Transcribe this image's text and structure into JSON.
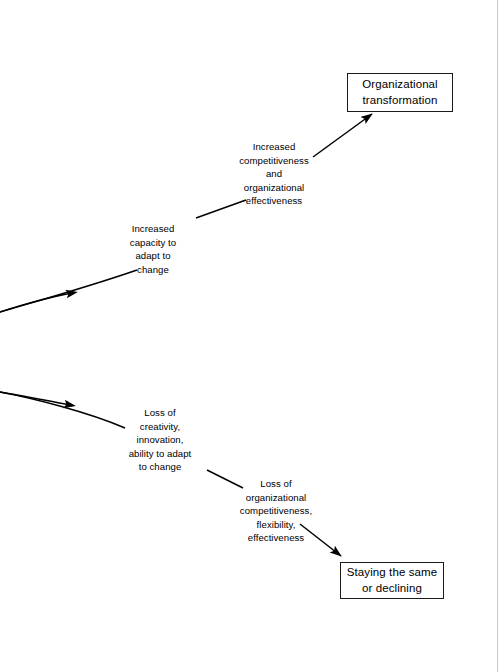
{
  "page": {
    "background_color": "#ffffff",
    "ink_color": "#000000",
    "scan_artifact_color": "#c9c9c9",
    "width": 503,
    "height": 672
  },
  "diagram": {
    "type": "flow-cascade",
    "boxes": [
      {
        "id": "transformation",
        "label": "Organizational\ntransformation",
        "line1": "Organizational",
        "line2": "transformation",
        "x": 347,
        "y": 73,
        "width": 106,
        "height": 39,
        "border_color": "#1a1a1a"
      },
      {
        "id": "staying-same",
        "label": "Staying the same\nor declining",
        "line1": "Staying the same",
        "line2": "or declining",
        "x": 340,
        "y": 562,
        "width": 104,
        "height": 37,
        "border_color": "#1a1a1a"
      }
    ],
    "labels": [
      {
        "id": "competitiveness",
        "text": "Increased\ncompetitiveness\nand\norganizational\neffectiveness",
        "x": 222,
        "y": 140,
        "chain": "upward"
      },
      {
        "id": "capacity",
        "text": "Increased\ncapacity to\nadapt to\nchange",
        "x": 101,
        "y": 222,
        "chain": "upward"
      },
      {
        "id": "loss-creativity",
        "text": "Loss of\ncreativity,\ninnovation,\nability to adapt\nto change",
        "x": 104,
        "y": 406,
        "chain": "downward"
      },
      {
        "id": "loss-competitiveness",
        "text": "Loss of\norganizational\ncompetitiveness,\nflexibility,\neffectiveness",
        "x": 220,
        "y": 477,
        "chain": "downward"
      }
    ],
    "connectors": [
      {
        "id": "curve-upper-left",
        "kind": "curve",
        "arrowhead": "mid",
        "direction": "right",
        "from": "left page edge",
        "to": "increased capacity to adapt to change"
      },
      {
        "id": "segment-capacity-to-competitiveness",
        "kind": "line",
        "arrowhead": "none",
        "direction": "up-right",
        "from": "increased capacity to adapt to change",
        "to": "increased competitiveness and organizational effectiveness"
      },
      {
        "id": "arrow-to-transformation",
        "kind": "line",
        "arrowhead": "end",
        "direction": "up-right",
        "from": "increased competitiveness and organizational effectiveness",
        "to": "organizational transformation"
      },
      {
        "id": "curve-lower-left",
        "kind": "curve",
        "arrowhead": "mid",
        "direction": "right",
        "from": "left page edge",
        "to": "loss of creativity, innovation, ability to adapt to change"
      },
      {
        "id": "segment-creativity-to-competitiveness",
        "kind": "line",
        "arrowhead": "none",
        "direction": "down-right",
        "from": "loss of creativity, innovation, ability to adapt to change",
        "to": "loss of organizational competitiveness, flexibility, effectiveness"
      },
      {
        "id": "arrow-to-staying-same",
        "kind": "line",
        "arrowhead": "end",
        "direction": "down-right",
        "from": "loss of organizational competitiveness, flexibility, effectiveness",
        "to": "staying the same or declining"
      }
    ]
  }
}
